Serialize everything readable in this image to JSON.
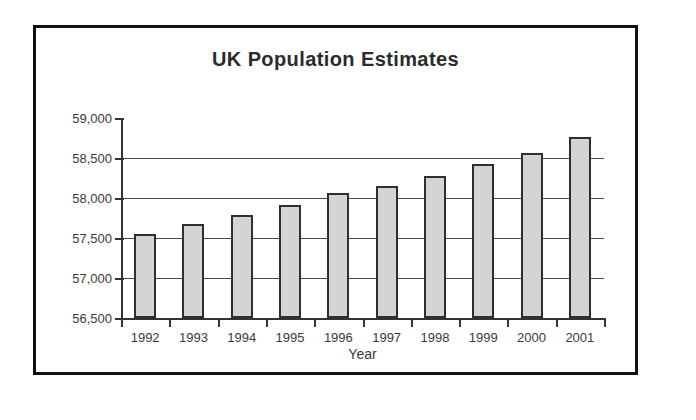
{
  "chart_data": {
    "type": "bar",
    "title": "UK Population Estimates",
    "xlabel": "Year",
    "ylabel": "",
    "categories": [
      "1992",
      "1993",
      "1994",
      "1995",
      "1996",
      "1997",
      "1998",
      "1999",
      "2000",
      "2001"
    ],
    "values": [
      57550,
      57670,
      57790,
      57910,
      58060,
      58150,
      58280,
      58430,
      58560,
      58760
    ],
    "ylim": [
      56500,
      59000
    ],
    "ytick_values": [
      59000,
      58500,
      58000,
      57500,
      57000,
      56500
    ],
    "ytick_labels": [
      "59,000",
      "58,500",
      "58,000",
      "57,500",
      "57,000",
      "56,500"
    ],
    "grid": true,
    "grid_axis": "y",
    "legend": false,
    "bar_fill_color": "#d4d4d4",
    "bar_border_color": "#2f2f2f",
    "frame_border_color": "#111111",
    "axis_color": "#333333",
    "text_color": "#3a3a3a"
  }
}
